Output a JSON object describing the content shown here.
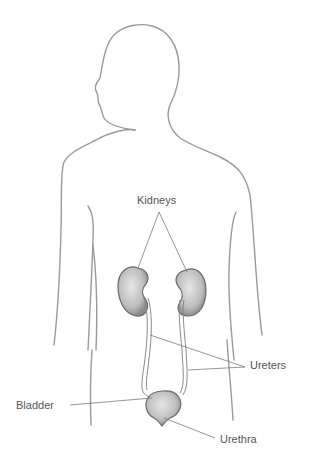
{
  "diagram": {
    "labels": {
      "kidneys": "Kidneys",
      "ureters": "Ureters",
      "bladder": "Bladder",
      "urethra": "Urethra"
    },
    "colors": {
      "outline": "#9a9a9a",
      "organ_fill": "#c8c8c8",
      "organ_stroke": "#6a6a6a",
      "leader_line": "#7a7a7a",
      "text": "#555555"
    }
  }
}
